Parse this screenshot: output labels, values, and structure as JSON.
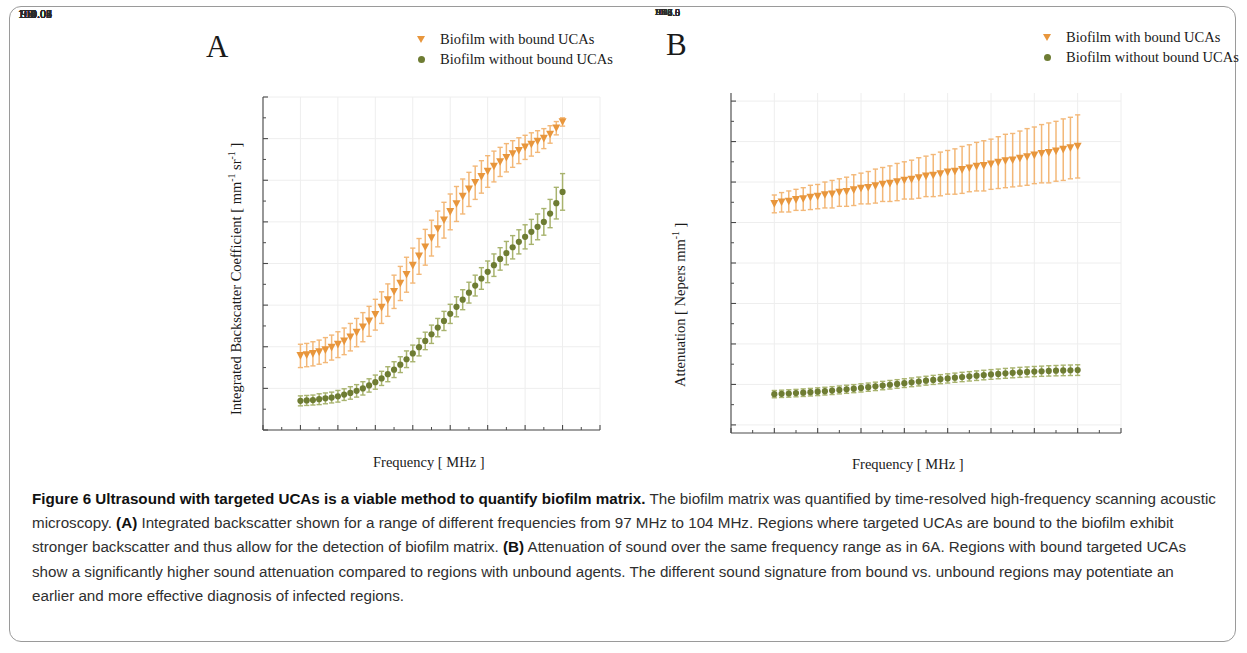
{
  "figure": {
    "border_color": "#9a9a9a",
    "caption_label": "Figure 6",
    "caption_title": "Ultrasound with targeted UCAs is a viable method to quantify biofilm matrix.",
    "caption_body_1": " The biofilm matrix was quantified by time-resolved high-frequency scanning acoustic microscopy. ",
    "caption_tag_a": "(A)",
    "caption_body_2": " Integrated backscatter shown for a range of different frequencies from 97 MHz to 104 MHz. Regions where targeted UCAs are bound to the biofilm exhibit stronger backscatter and thus allow for the detection of biofilm matrix. ",
    "caption_tag_b": "(B)",
    "caption_body_3": " Attenuation of sound over the same frequency range as in 6A. Regions with bound targeted UCAs show a significantly higher sound attenuation compared to regions with unbound agents. The different sound signature from bound vs. unbound regions may potentiate an earlier and more effective diagnosis of infected regions."
  },
  "colors": {
    "orange": "#E8963C",
    "orange_light": "#F3B878",
    "green": "#6E7C33",
    "green_light": "#A8B36E",
    "axis": "#4a4a4a",
    "grid": "#eeeeee"
  },
  "panel_a": {
    "letter": "A",
    "legend": [
      {
        "label": "Biofilm with bound UCAs",
        "marker": "triangle-down",
        "color": "#E8963C"
      },
      {
        "label": "Biofilm without bound UCAs",
        "marker": "circle",
        "color": "#6E7C33"
      }
    ]
  },
  "panel_b": {
    "letter": "B",
    "legend": [
      {
        "label": "Biofilm with bound UCAs",
        "marker": "triangle-down",
        "color": "#E8963C"
      },
      {
        "label": "Biofilm without bound UCAs",
        "marker": "circle",
        "color": "#6E7C33"
      }
    ]
  },
  "chart_data": [
    {
      "panel": "A",
      "type": "scatter",
      "title": "",
      "xlabel": "Frequency [ MHz ]",
      "ylabel": "Integrated Backscatter Coefficient [ mm⁻¹ sr⁻¹ ]",
      "ylabel_parts": {
        "pre": "Integrated Backscatter Coefficient [ mm",
        "sup1": "-1",
        "mid": " sr",
        "sup2": "-1",
        "post": " ]"
      },
      "xlim": [
        96,
        105
      ],
      "ylim": [
        0.01,
        0.09
      ],
      "xticks": [
        96,
        97,
        98,
        99,
        100,
        101,
        102,
        103,
        104,
        105
      ],
      "xticklabels": [
        "96",
        "97",
        "98",
        "99",
        "100",
        "101",
        "102",
        "103",
        "104",
        "105"
      ],
      "yticks": [
        0.01,
        0.02,
        0.03,
        0.04,
        0.05,
        0.06,
        0.07,
        0.08,
        0.09
      ],
      "yticklabels": [
        "0.01",
        "0.02",
        "0.03",
        "0.04",
        "0.05",
        "0.06",
        "0.07",
        "0.08",
        "0.09"
      ],
      "grid": true,
      "legend_position": "top-right-outside",
      "x": [
        97.0,
        97.167,
        97.333,
        97.5,
        97.667,
        97.833,
        98.0,
        98.167,
        98.333,
        98.5,
        98.667,
        98.833,
        99.0,
        99.167,
        99.333,
        99.5,
        99.667,
        99.833,
        100.0,
        100.167,
        100.333,
        100.5,
        100.667,
        100.833,
        101.0,
        101.167,
        101.333,
        101.5,
        101.667,
        101.833,
        102.0,
        102.167,
        102.333,
        102.5,
        102.667,
        102.833,
        103.0,
        103.167,
        103.333,
        103.5,
        103.667,
        103.833,
        104.0
      ],
      "series": [
        {
          "name": "Biofilm with bound UCAs",
          "marker": "triangle-down",
          "color": "#E8963C",
          "values": [
            0.0278,
            0.028,
            0.0283,
            0.0287,
            0.0292,
            0.0298,
            0.0305,
            0.0313,
            0.0323,
            0.0334,
            0.0347,
            0.0361,
            0.0377,
            0.0394,
            0.0412,
            0.0432,
            0.0452,
            0.0473,
            0.0495,
            0.0517,
            0.0539,
            0.0561,
            0.0583,
            0.0604,
            0.0624,
            0.0643,
            0.0661,
            0.0678,
            0.0694,
            0.0708,
            0.0721,
            0.0733,
            0.0744,
            0.0754,
            0.0763,
            0.0771,
            0.0779,
            0.0786,
            0.0793,
            0.08,
            0.081,
            0.0825,
            0.084
          ],
          "errors": [
            0.0028,
            0.0028,
            0.0029,
            0.0029,
            0.003,
            0.003,
            0.0031,
            0.0032,
            0.0033,
            0.0034,
            0.0035,
            0.0036,
            0.0037,
            0.0038,
            0.0039,
            0.004,
            0.0041,
            0.0042,
            0.0042,
            0.0043,
            0.0043,
            0.0043,
            0.0043,
            0.0043,
            0.0043,
            0.0042,
            0.0042,
            0.0041,
            0.004,
            0.0039,
            0.0038,
            0.0037,
            0.0035,
            0.0034,
            0.0032,
            0.0031,
            0.0029,
            0.0028,
            0.0026,
            0.0024,
            0.0021,
            0.0016,
            0.001
          ]
        },
        {
          "name": "Biofilm without bound UCAs",
          "marker": "circle",
          "color": "#6E7C33",
          "values": [
            0.017,
            0.0171,
            0.0172,
            0.0174,
            0.0176,
            0.0178,
            0.0181,
            0.0185,
            0.0189,
            0.0194,
            0.02,
            0.0207,
            0.0215,
            0.0224,
            0.0234,
            0.0245,
            0.0257,
            0.027,
            0.0284,
            0.0299,
            0.0314,
            0.033,
            0.0346,
            0.0362,
            0.0379,
            0.0396,
            0.0413,
            0.043,
            0.0447,
            0.0464,
            0.048,
            0.0496,
            0.0511,
            0.0525,
            0.0539,
            0.0552,
            0.0564,
            0.0576,
            0.0588,
            0.06,
            0.062,
            0.0645,
            0.0672
          ],
          "errors": [
            0.0012,
            0.0012,
            0.0012,
            0.0013,
            0.0013,
            0.0013,
            0.0014,
            0.0014,
            0.0015,
            0.0015,
            0.0016,
            0.0016,
            0.0017,
            0.0017,
            0.0018,
            0.0019,
            0.0019,
            0.002,
            0.002,
            0.0021,
            0.0021,
            0.0022,
            0.0022,
            0.0023,
            0.0023,
            0.0024,
            0.0024,
            0.0025,
            0.0025,
            0.0026,
            0.0026,
            0.0027,
            0.0027,
            0.0028,
            0.0028,
            0.0029,
            0.0029,
            0.003,
            0.0031,
            0.0032,
            0.0034,
            0.0038,
            0.0044
          ]
        }
      ]
    },
    {
      "panel": "B",
      "type": "scatter",
      "title": "",
      "xlabel": "Frequency [ MHz ]",
      "ylabel": "Attenuation [ Nepers mm⁻¹ ]",
      "ylabel_parts": {
        "pre": "Attenuation [ Nepers mm",
        "sup1": "-1",
        "post": " ]"
      },
      "xlim": [
        96,
        105
      ],
      "ylim": [
        3.4,
        7.6
      ],
      "xticks": [
        96,
        97,
        98,
        99,
        100,
        101,
        102,
        103,
        104,
        105
      ],
      "xticklabels": [
        "96",
        "97",
        "98",
        "99",
        "100",
        "101",
        "102",
        "103",
        "104",
        "105"
      ],
      "yticks": [
        3.5,
        4.0,
        4.5,
        5.0,
        5.5,
        6.0,
        6.5,
        7.0,
        7.5
      ],
      "yticklabels": [
        "3.5",
        "4.0",
        "4.5",
        "5.0",
        "5.5",
        "6.0",
        "6.5",
        "7.0",
        "7.5"
      ],
      "grid": true,
      "legend_position": "top-right-outside",
      "x": [
        97.0,
        97.167,
        97.333,
        97.5,
        97.667,
        97.833,
        98.0,
        98.167,
        98.333,
        98.5,
        98.667,
        98.833,
        99.0,
        99.167,
        99.333,
        99.5,
        99.667,
        99.833,
        100.0,
        100.167,
        100.333,
        100.5,
        100.667,
        100.833,
        101.0,
        101.167,
        101.333,
        101.5,
        101.667,
        101.833,
        102.0,
        102.167,
        102.333,
        102.5,
        102.667,
        102.833,
        103.0,
        103.167,
        103.333,
        103.5,
        103.667,
        103.833,
        104.0
      ],
      "series": [
        {
          "name": "Biofilm with bound UCAs",
          "marker": "triangle-down",
          "color": "#E8963C",
          "values": [
            6.23,
            6.25,
            6.26,
            6.28,
            6.29,
            6.31,
            6.32,
            6.34,
            6.35,
            6.37,
            6.38,
            6.4,
            6.42,
            6.43,
            6.45,
            6.47,
            6.48,
            6.5,
            6.52,
            6.53,
            6.55,
            6.57,
            6.58,
            6.6,
            6.62,
            6.63,
            6.65,
            6.67,
            6.69,
            6.7,
            6.72,
            6.74,
            6.76,
            6.77,
            6.79,
            6.81,
            6.83,
            6.85,
            6.86,
            6.88,
            6.9,
            6.92,
            6.94
          ],
          "errors": [
            0.11,
            0.12,
            0.13,
            0.13,
            0.14,
            0.15,
            0.15,
            0.16,
            0.17,
            0.17,
            0.18,
            0.19,
            0.19,
            0.2,
            0.21,
            0.21,
            0.22,
            0.23,
            0.23,
            0.24,
            0.25,
            0.25,
            0.26,
            0.27,
            0.27,
            0.28,
            0.29,
            0.29,
            0.3,
            0.31,
            0.31,
            0.32,
            0.33,
            0.33,
            0.34,
            0.35,
            0.35,
            0.36,
            0.37,
            0.37,
            0.38,
            0.38,
            0.39
          ]
        },
        {
          "name": "Biofilm without bound UCAs",
          "marker": "circle",
          "color": "#6E7C33",
          "values": [
            3.88,
            3.884,
            3.888,
            3.893,
            3.898,
            3.904,
            3.91,
            3.917,
            3.924,
            3.932,
            3.94,
            3.948,
            3.957,
            3.966,
            3.976,
            3.986,
            3.996,
            4.006,
            4.016,
            4.026,
            4.036,
            4.046,
            4.056,
            4.065,
            4.074,
            4.083,
            4.092,
            4.1,
            4.108,
            4.116,
            4.123,
            4.13,
            4.137,
            4.143,
            4.149,
            4.154,
            4.159,
            4.163,
            4.167,
            4.17,
            4.173,
            4.175,
            4.177
          ],
          "errors": [
            0.045,
            0.045,
            0.046,
            0.046,
            0.047,
            0.047,
            0.048,
            0.048,
            0.049,
            0.049,
            0.05,
            0.05,
            0.051,
            0.051,
            0.052,
            0.052,
            0.053,
            0.053,
            0.054,
            0.054,
            0.055,
            0.055,
            0.056,
            0.056,
            0.057,
            0.057,
            0.058,
            0.058,
            0.059,
            0.059,
            0.06,
            0.06,
            0.061,
            0.061,
            0.062,
            0.062,
            0.063,
            0.063,
            0.064,
            0.064,
            0.065,
            0.065,
            0.066
          ]
        }
      ]
    }
  ]
}
